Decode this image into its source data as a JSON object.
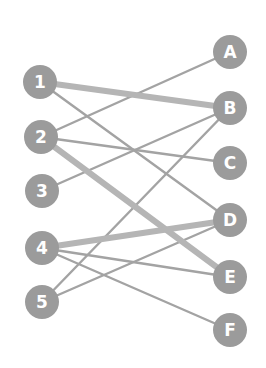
{
  "diagram": {
    "type": "bipartite-graph",
    "colors": {
      "node_fill": "#9b9b9b",
      "label": "#ffffff",
      "edge_thin": "#a3a3a3",
      "edge_thick": "#b5b5b5",
      "background": "#ffffff"
    },
    "left_nodes": [
      {
        "id": "1",
        "label": "1",
        "x": 40,
        "y": 82
      },
      {
        "id": "2",
        "label": "2",
        "x": 41,
        "y": 137
      },
      {
        "id": "3",
        "label": "3",
        "x": 42,
        "y": 191
      },
      {
        "id": "4",
        "label": "4",
        "x": 42,
        "y": 248
      },
      {
        "id": "5",
        "label": "5",
        "x": 42,
        "y": 302
      }
    ],
    "right_nodes": [
      {
        "id": "A",
        "label": "A",
        "x": 230,
        "y": 52
      },
      {
        "id": "B",
        "label": "B",
        "x": 230,
        "y": 108
      },
      {
        "id": "C",
        "label": "C",
        "x": 230,
        "y": 163
      },
      {
        "id": "D",
        "label": "D",
        "x": 230,
        "y": 220
      },
      {
        "id": "E",
        "label": "E",
        "x": 230,
        "y": 277
      },
      {
        "id": "F",
        "label": "F",
        "x": 230,
        "y": 330
      }
    ],
    "edges": [
      {
        "from": "1",
        "to": "B",
        "weight": "thick"
      },
      {
        "from": "1",
        "to": "D",
        "weight": "thin"
      },
      {
        "from": "2",
        "to": "A",
        "weight": "thin"
      },
      {
        "from": "2",
        "to": "C",
        "weight": "thin"
      },
      {
        "from": "2",
        "to": "E",
        "weight": "thick"
      },
      {
        "from": "3",
        "to": "B",
        "weight": "thin"
      },
      {
        "from": "4",
        "to": "D",
        "weight": "thick"
      },
      {
        "from": "4",
        "to": "E",
        "weight": "thin"
      },
      {
        "from": "4",
        "to": "F",
        "weight": "thin"
      },
      {
        "from": "5",
        "to": "B",
        "weight": "thin"
      },
      {
        "from": "5",
        "to": "D",
        "weight": "thin"
      }
    ],
    "node_radius": 17
  }
}
